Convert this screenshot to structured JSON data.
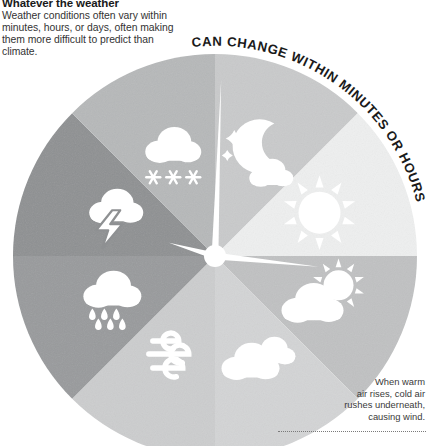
{
  "intro": {
    "title": "Whatever the weather",
    "body": "Weather conditions often vary within minutes, hours, or days, often making them more difficult to predict than climate."
  },
  "arc_label": {
    "text": "CAN CHANGE WITHIN MINUTES OR HOURS"
  },
  "wind_caption": {
    "line1": "When warm",
    "line2": "air rises, cold air",
    "line3": "rushes underneath,",
    "line4": "causing wind."
  },
  "wheel": {
    "center_x": 215,
    "center_y": 256,
    "radius": 202,
    "hub_radius": 11,
    "segments": [
      {
        "name": "segment-night",
        "icon": "moon-stars-cloud-icon",
        "start_deg": 270,
        "end_deg": 315,
        "color": "#c9cacb"
      },
      {
        "name": "segment-sun",
        "icon": "sun-icon",
        "start_deg": 315,
        "end_deg": 0,
        "color": "#eeefef"
      },
      {
        "name": "segment-sun-cloud",
        "icon": "sun-behind-cloud-icon",
        "start_deg": 0,
        "end_deg": 45,
        "color": "#c0c1c2"
      },
      {
        "name": "segment-clouds",
        "icon": "clouds-icon",
        "start_deg": 45,
        "end_deg": 90,
        "color": "#d3d4d5"
      },
      {
        "name": "segment-wind",
        "icon": "wind-icon",
        "start_deg": 90,
        "end_deg": 135,
        "color": "#cccdce"
      },
      {
        "name": "segment-rain",
        "icon": "rain-cloud-icon",
        "start_deg": 135,
        "end_deg": 180,
        "color": "#989a9c"
      },
      {
        "name": "segment-thunderstorm",
        "icon": "thunderstorm-icon",
        "start_deg": 180,
        "end_deg": 225,
        "color": "#8e9092"
      },
      {
        "name": "segment-snow",
        "icon": "snow-cloud-icon",
        "start_deg": 225,
        "end_deg": 270,
        "color": "#b6b8b9"
      }
    ],
    "hands": [
      {
        "name": "clock-hand-up",
        "angle_deg": 272,
        "length": 176
      },
      {
        "name": "clock-hand-right",
        "angle_deg": 6,
        "length": 104
      },
      {
        "name": "clock-hand-left",
        "angle_deg": 196,
        "length": 48
      }
    ]
  },
  "colors": {
    "icon_fill": "#ffffff",
    "arc_text": "#1a1a1a",
    "background": "#ffffff"
  }
}
